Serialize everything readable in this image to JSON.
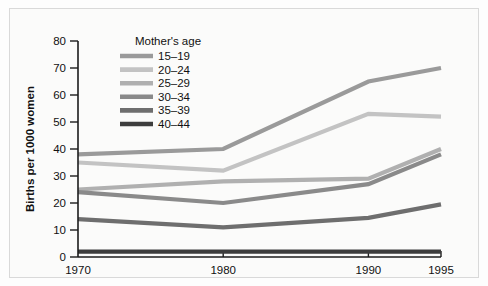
{
  "figure": {
    "background_color": "#fbfbfa",
    "border_color": "#d9d9d9"
  },
  "chart_data": {
    "type": "line",
    "title": "",
    "xlabel": "",
    "ylabel": "Births per 1000 women",
    "x": [
      1970,
      1980,
      1990,
      1995
    ],
    "xtick_labels": [
      "1970",
      "1980",
      "1990",
      "1995"
    ],
    "ytick_labels": [
      "0",
      "10",
      "20",
      "30",
      "40",
      "50",
      "60",
      "70",
      "80"
    ],
    "yticks": [
      0,
      10,
      20,
      30,
      40,
      50,
      60,
      70,
      80
    ],
    "ylim": [
      0,
      80
    ],
    "xlim": [
      1970,
      1995
    ],
    "grid": false,
    "legend_position": "upper-left-inside",
    "legend_title": "Mother's age",
    "series": [
      {
        "name": "15–19",
        "values": [
          38,
          40,
          65,
          70
        ],
        "color": "#9a9a9a"
      },
      {
        "name": "20–24",
        "values": [
          35,
          32,
          53,
          52
        ],
        "color": "#c3c3c3"
      },
      {
        "name": "25–29",
        "values": [
          25,
          28,
          29,
          40
        ],
        "color": "#b0b0b0"
      },
      {
        "name": "30–34",
        "values": [
          24,
          20,
          27,
          38
        ],
        "color": "#8a8a8a"
      },
      {
        "name": "35–39",
        "values": [
          14,
          11,
          14.5,
          19.5
        ],
        "color": "#6e6e6e"
      },
      {
        "name": "40–44",
        "values": [
          2,
          2,
          2,
          2
        ],
        "color": "#3d3d3d"
      }
    ]
  }
}
